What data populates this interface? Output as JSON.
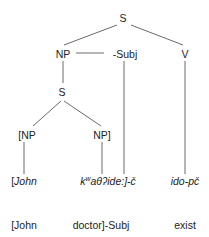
{
  "tree": {
    "nodes": {
      "root_s": "S",
      "np": "NP",
      "subj": "-Subj",
      "v": "V",
      "inner_s": "S",
      "np_left": "[NP",
      "np_right": "NP]"
    },
    "leaves": {
      "john": "[John",
      "doctor_prefix": "k",
      "doctor_sup": "w",
      "doctor_rest": "aθʔide:]-č",
      "verb": "ido-pč"
    },
    "glosses": {
      "john": "[John",
      "doctor": "doctor]-Subj",
      "exist": "exist"
    }
  }
}
